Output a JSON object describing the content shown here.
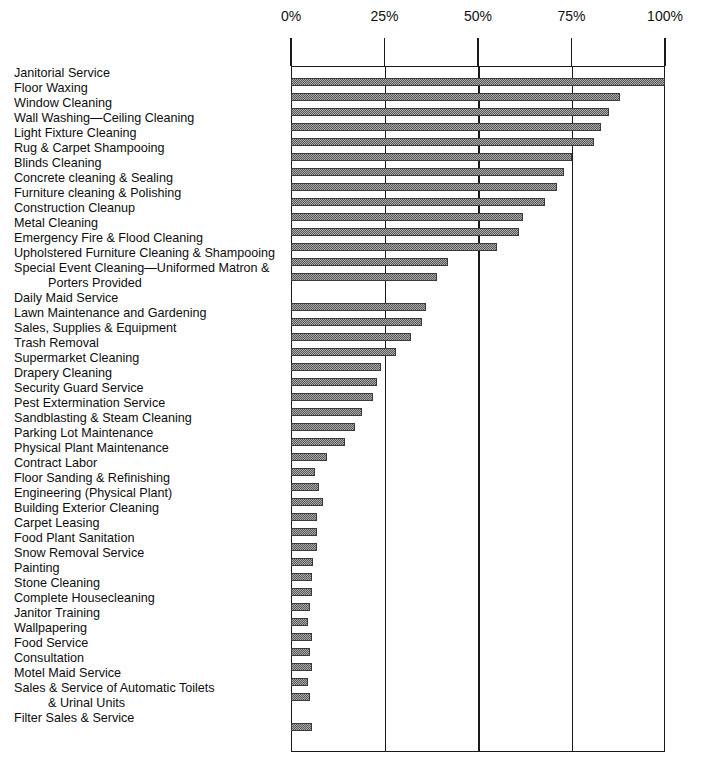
{
  "title_clipped": "",
  "axis": {
    "ticks": [
      "0%",
      "25%",
      "50%",
      "75%",
      "100%"
    ],
    "tick_values": [
      0,
      25,
      50,
      75,
      100
    ]
  },
  "chart_data": {
    "type": "bar",
    "orientation": "horizontal",
    "title": "",
    "subtitle": "",
    "xlabel": "",
    "ylabel": "",
    "xlim": [
      0,
      100
    ],
    "xticks": [
      0,
      25,
      50,
      75,
      100
    ],
    "xticklabels": [
      "0%",
      "25%",
      "50%",
      "75%",
      "100%"
    ],
    "grid": true,
    "grid_axis": "x",
    "legend": false,
    "bar_color": "#595959",
    "bar_pattern": "fine-dotted-halftone",
    "categories": [
      "Janitorial Service",
      "Floor Waxing",
      "Window Cleaning",
      "Wall Washing—Ceiling Cleaning",
      "Light Fixture Cleaning",
      "Rug & Carpet Shampooing",
      "Blinds Cleaning",
      "Concrete cleaning & Sealing",
      "Furniture cleaning & Polishing",
      "Construction Cleanup",
      "Metal Cleaning",
      "Emergency Fire & Flood Cleaning",
      "Upholstered Furniture Cleaning & Shampooing",
      "Special Event Cleaning—Uniformed Matron & Porters Provided",
      "Daily Maid Service",
      "Lawn Maintenance and Gardening",
      "Sales, Supplies & Equipment",
      "Trash Removal",
      "Supermarket Cleaning",
      "Drapery Cleaning",
      "Security Guard Service",
      "Pest Extermination Service",
      "Sandblasting & Steam Cleaning",
      "Parking Lot Maintenance",
      "Physical Plant Maintenance",
      "Contract Labor",
      "Floor Sanding & Refinishing",
      "Engineering (Physical Plant)",
      "Building Exterior Cleaning",
      "Carpet Leasing",
      "Food Plant Sanitation",
      "Snow Removal Service",
      "Painting",
      "Stone Cleaning",
      "Complete Housecleaning",
      "Janitor Training",
      "Wallpapering",
      "Food Service",
      "Consultation",
      "Motel Maid Service",
      "Sales & Service of Automatic Toilets & Urinal Units",
      "Filter Sales & Service"
    ],
    "values": [
      100,
      88,
      85,
      83,
      81,
      75,
      73,
      71,
      68,
      62,
      61,
      55,
      42,
      39,
      36,
      35,
      32,
      28,
      24,
      23,
      22,
      19,
      17,
      14.5,
      9.5,
      6.5,
      7.5,
      8.5,
      7,
      7,
      7,
      6,
      5.5,
      5.5,
      5,
      4.5,
      5.5,
      5,
      5.5,
      4.5,
      5,
      5.5
    ]
  },
  "labels": {
    "rows": [
      {
        "text": "Janitorial Service",
        "line2": null
      },
      {
        "text": "Floor Waxing",
        "line2": null
      },
      {
        "text": "Window Cleaning",
        "line2": null
      },
      {
        "text": "Wall Washing—Ceiling Cleaning",
        "line2": null
      },
      {
        "text": "Light Fixture Cleaning",
        "line2": null
      },
      {
        "text": "Rug & Carpet Shampooing",
        "line2": null
      },
      {
        "text": "Blinds Cleaning",
        "line2": null
      },
      {
        "text": "Concrete cleaning & Sealing",
        "line2": null
      },
      {
        "text": "Furniture cleaning & Polishing",
        "line2": null
      },
      {
        "text": "Construction Cleanup",
        "line2": null
      },
      {
        "text": "Metal Cleaning",
        "line2": null
      },
      {
        "text": "Emergency Fire & Flood Cleaning",
        "line2": null
      },
      {
        "text": "Upholstered Furniture Cleaning & Shampooing",
        "line2": null
      },
      {
        "text": "Special Event Cleaning—Uniformed Matron &",
        "line2": "Porters Provided"
      },
      {
        "text": "Daily Maid Service",
        "line2": null
      },
      {
        "text": "Lawn Maintenance and Gardening",
        "line2": null
      },
      {
        "text": "Sales, Supplies & Equipment",
        "line2": null
      },
      {
        "text": "Trash Removal",
        "line2": null
      },
      {
        "text": "Supermarket Cleaning",
        "line2": null
      },
      {
        "text": "Drapery Cleaning",
        "line2": null
      },
      {
        "text": "Security Guard Service",
        "line2": null
      },
      {
        "text": "Pest Extermination Service",
        "line2": null
      },
      {
        "text": "Sandblasting & Steam Cleaning",
        "line2": null
      },
      {
        "text": "Parking Lot Maintenance",
        "line2": null
      },
      {
        "text": "Physical Plant Maintenance",
        "line2": null
      },
      {
        "text": "Contract Labor",
        "line2": null
      },
      {
        "text": "Floor Sanding & Refinishing",
        "line2": null
      },
      {
        "text": "Engineering (Physical Plant)",
        "line2": null
      },
      {
        "text": "Building Exterior Cleaning",
        "line2": null
      },
      {
        "text": "Carpet Leasing",
        "line2": null
      },
      {
        "text": "Food Plant Sanitation",
        "line2": null
      },
      {
        "text": "Snow Removal Service",
        "line2": null
      },
      {
        "text": "Painting",
        "line2": null
      },
      {
        "text": "Stone Cleaning",
        "line2": null
      },
      {
        "text": "Complete Housecleaning",
        "line2": null
      },
      {
        "text": "Janitor Training",
        "line2": null
      },
      {
        "text": "Wallpapering",
        "line2": null
      },
      {
        "text": "Food Service",
        "line2": null
      },
      {
        "text": "Consultation",
        "line2": null
      },
      {
        "text": "Motel Maid Service",
        "line2": null
      },
      {
        "text": "Sales & Service of Automatic Toilets",
        "line2": "& Urinal Units"
      },
      {
        "text": "Filter Sales & Service",
        "line2": null
      }
    ]
  }
}
